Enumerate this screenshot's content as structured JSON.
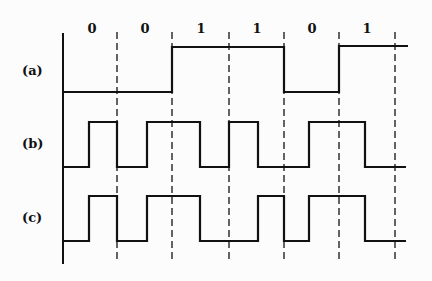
{
  "diagram": {
    "title": "",
    "bits": [
      "0",
      "0",
      "1",
      "1",
      "0",
      "1"
    ],
    "row_labels": [
      "(a)",
      "(b)",
      "(c)"
    ],
    "colors": {
      "line": "#111111",
      "background": "#fcfcfc"
    }
  },
  "geometry": {
    "axis_x": 63,
    "dashed_x": [
      117,
      172,
      229,
      284,
      339,
      395
    ],
    "bit_label_x": [
      92,
      145,
      201,
      257,
      312,
      367
    ],
    "waves": {
      "a": "M63,92 H172 V47 H284 V92 H339 V46 H408",
      "b": "M63,167 H89 V122 H117 V167 H147 V122 H200 V167 H229 V122 H258 V167 H309 V122 H365 V167 H406",
      "c": "M63,241 H89 V196 H117 V241 H147 V196 H200 V241 H258 V196 H284 V241 H309 V196 H365 V241 H406"
    }
  }
}
